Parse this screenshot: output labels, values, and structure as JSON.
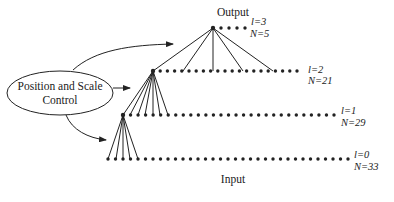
{
  "diagram": {
    "controller": {
      "line1": "Position and Scale",
      "line2": "Control"
    },
    "top_label": "Output",
    "bottom_label": "Input",
    "levels": [
      {
        "l_label": "l=3",
        "n_label": "N=5",
        "level": 3,
        "nodes": 5
      },
      {
        "l_label": "l=2",
        "n_label": "N=21",
        "level": 2,
        "nodes": 21
      },
      {
        "l_label": "l=1",
        "n_label": "N=29",
        "level": 1,
        "nodes": 29
      },
      {
        "l_label": "l=0",
        "n_label": "N=33",
        "level": 0,
        "nodes": 33
      }
    ],
    "colors": {
      "ink": "#222222",
      "background": "#ffffff"
    }
  }
}
